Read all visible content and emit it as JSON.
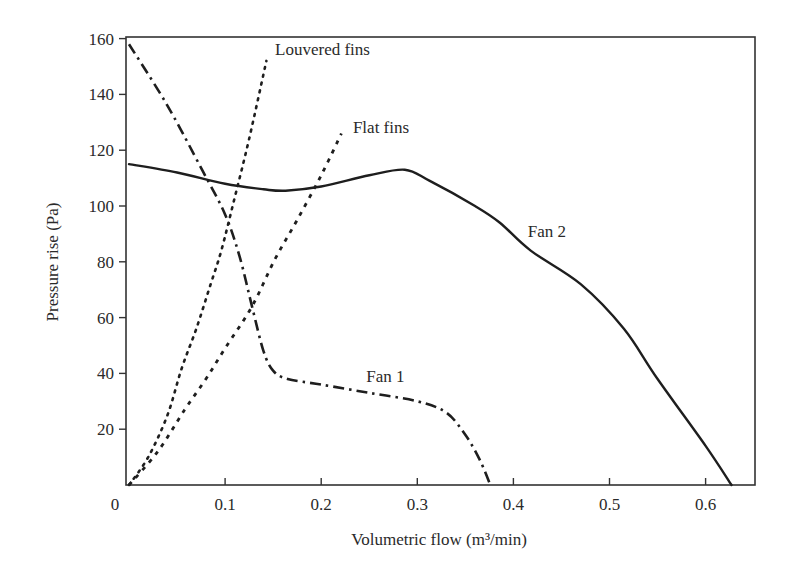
{
  "chart_data": {
    "type": "line",
    "title": "",
    "xlabel": "Volumetric flow (m³/min)",
    "ylabel": "Pressure rise (Pa)",
    "xlim": [
      0,
      0.65
    ],
    "ylim": [
      0,
      160
    ],
    "grid": false,
    "legend": "none (inline annotations)",
    "x_ticks": [
      "0",
      "0.1",
      "0.2",
      "0.3",
      "0.4",
      "0.5",
      "0.6"
    ],
    "y_ticks": [
      "20",
      "40",
      "60",
      "80",
      "100",
      "120",
      "140",
      "160"
    ],
    "series": [
      {
        "name": "Fan 1",
        "style": "dash-dot",
        "x": [
          0.0,
          0.04,
          0.076,
          0.1,
          0.115,
          0.128,
          0.14,
          0.15,
          0.165,
          0.2,
          0.25,
          0.3,
          0.33,
          0.35,
          0.365,
          0.376
        ],
        "y": [
          158,
          136,
          113,
          97,
          82,
          64,
          48,
          41,
          38,
          36,
          33,
          30,
          26,
          18,
          9,
          0
        ]
      },
      {
        "name": "Fan 2",
        "style": "solid",
        "x": [
          0.0,
          0.05,
          0.1,
          0.14,
          0.163,
          0.2,
          0.25,
          0.287,
          0.313,
          0.36,
          0.386,
          0.418,
          0.47,
          0.515,
          0.55,
          0.6,
          0.627
        ],
        "y": [
          115,
          112,
          108,
          106,
          105.5,
          107,
          111,
          113,
          109,
          100,
          94,
          84,
          72,
          56,
          38,
          14,
          0
        ]
      },
      {
        "name": "Louvered fins",
        "style": "dotted",
        "x": [
          0.0,
          0.02,
          0.04,
          0.055,
          0.07,
          0.085,
          0.096,
          0.11,
          0.125,
          0.143
        ],
        "y": [
          0,
          10,
          25,
          42,
          56,
          72,
          84,
          103,
          124,
          152
        ]
      },
      {
        "name": "Flat fins",
        "style": "dashed",
        "x": [
          0.0,
          0.03,
          0.058,
          0.08,
          0.1,
          0.128,
          0.152,
          0.175,
          0.2,
          0.221
        ],
        "y": [
          0,
          12,
          27,
          38,
          49,
          64,
          81,
          95,
          111,
          126
        ]
      }
    ],
    "annotations": [
      {
        "text": "Louvered fins",
        "x": 0.152,
        "y": 154
      },
      {
        "text": "Flat fins",
        "x": 0.233,
        "y": 126
      },
      {
        "text": "Fan 2",
        "x": 0.415,
        "y": 89
      },
      {
        "text": "Fan 1",
        "x": 0.247,
        "y": 37
      }
    ]
  },
  "labels": {
    "xlabel": "Volumetric flow (m³/min)",
    "ylabel": "Pressure rise (Pa)",
    "ann_louvered": "Louvered fins",
    "ann_flat": "Flat fins",
    "ann_fan2": "Fan 2",
    "ann_fan1": "Fan 1"
  },
  "colors": {
    "line": "#1e1e1e",
    "axis": "#333333"
  }
}
